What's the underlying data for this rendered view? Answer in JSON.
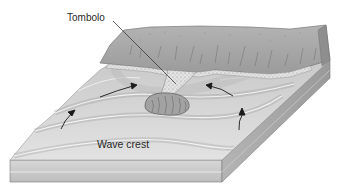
{
  "figure": {
    "labels": {
      "tombolo": "Tombolo",
      "wave_crest": "Wave crest"
    },
    "colors": {
      "background": "#ffffff",
      "land_top": "#a9a9a9",
      "land_shadow": "#8c8c8c",
      "sand": "#d9d9d9",
      "water_light": "#e4e4e4",
      "water_mid": "#cfcfcf",
      "water_dark": "#b5b5b5",
      "block_side": "#c8c8c8",
      "block_side_dark": "#9e9e9e",
      "arrow": "#1a1a1a",
      "text": "#2a2a2a"
    },
    "elements": [
      "mainland-cliff",
      "sandy-beach",
      "tombolo-sand-bar",
      "offshore-island",
      "wave-crests",
      "refraction-arrows"
    ],
    "arrow_count": 4
  }
}
